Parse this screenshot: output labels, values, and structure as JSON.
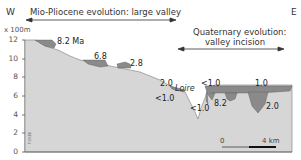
{
  "directions": {
    "west": "W",
    "east": "E"
  },
  "periods": {
    "mio_pliocene": "Mio-Pliocene evolution: large valley",
    "quaternary_line1": "Quaternary evolution:",
    "quaternary_line2": "valley incision"
  },
  "axis": {
    "unit": "x 100m",
    "ticks": [
      "12",
      "10",
      "8",
      "6",
      "4",
      "2",
      "0"
    ]
  },
  "ages": {
    "a1": "8.2 Ma",
    "a2": "6.8",
    "a3": "2.8",
    "a4": "2.0",
    "a5": "<1.0",
    "a6": "<1.0",
    "a7": "<1.0",
    "a8": "8.2",
    "a9": "1.0",
    "a10": "2.0"
  },
  "river": "Loire",
  "scale_bar": {
    "start": "0",
    "end": "4 km"
  },
  "figure_code": "F1936",
  "colors": {
    "bedrock": "#d6d6d6",
    "deposit": "#8a8a8a",
    "axis": "#555555",
    "scale_dark": "#111111",
    "scale_light": "#9a9a9a"
  }
}
